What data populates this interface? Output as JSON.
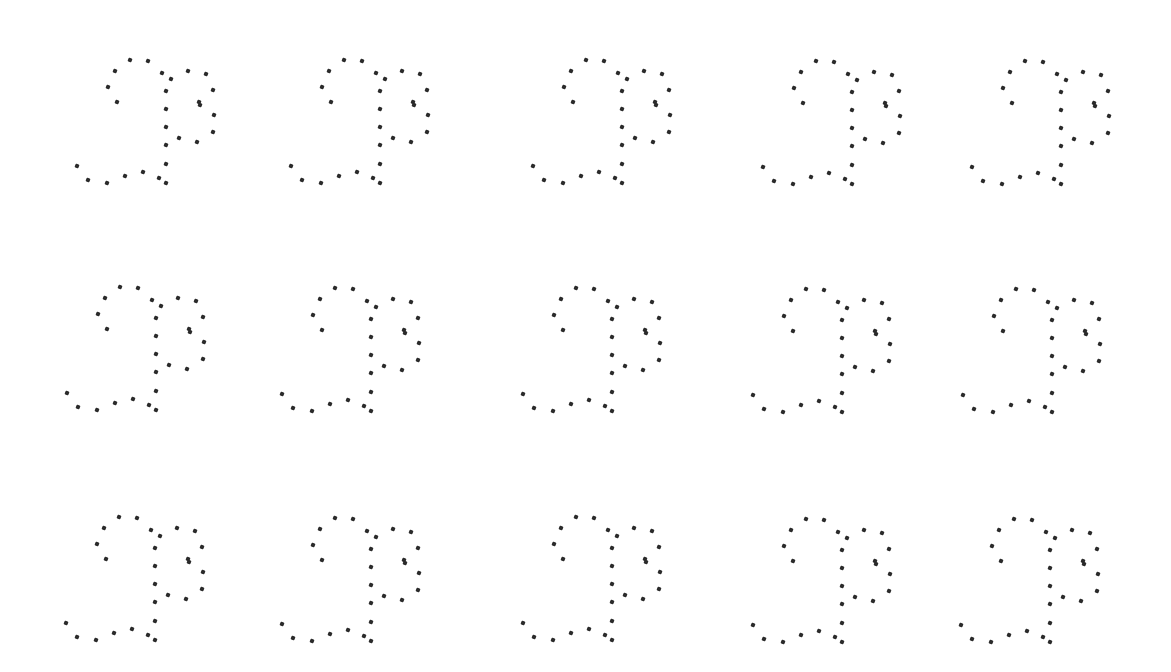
{
  "canvas": {
    "width": 1171,
    "height": 672,
    "background": "#ffffff",
    "dot_color": "#2a2a2a"
  },
  "glyph_dots": [
    [
      53,
      -106
    ],
    [
      71,
      -105
    ],
    [
      38,
      -95
    ],
    [
      31,
      -79
    ],
    [
      40,
      -64
    ],
    [
      85,
      -93
    ],
    [
      94,
      -87
    ],
    [
      111,
      -95
    ],
    [
      129,
      -92
    ],
    [
      136,
      -76
    ],
    [
      122,
      -64
    ],
    [
      123,
      -61
    ],
    [
      137,
      -51
    ],
    [
      136,
      -34
    ],
    [
      120,
      -24
    ],
    [
      102,
      -28
    ],
    [
      89,
      -75
    ],
    [
      89,
      -57
    ],
    [
      89,
      -39
    ],
    [
      89,
      -21
    ],
    [
      89,
      -2
    ],
    [
      89,
      17
    ],
    [
      0,
      0
    ],
    [
      11,
      14
    ],
    [
      30,
      17
    ],
    [
      48,
      10
    ],
    [
      66,
      6
    ],
    [
      82,
      12
    ]
  ],
  "grid": {
    "rows": 3,
    "cols": 5,
    "anchors": [
      [
        [
          77,
          166
        ],
        [
          291,
          166
        ],
        [
          533,
          166
        ],
        [
          763,
          167
        ],
        [
          972,
          167
        ]
      ],
      [
        [
          67,
          393
        ],
        [
          282,
          394
        ],
        [
          523,
          394
        ],
        [
          753,
          395
        ],
        [
          963,
          395
        ]
      ],
      [
        [
          66,
          623
        ],
        [
          282,
          624
        ],
        [
          523,
          623
        ],
        [
          753,
          625
        ],
        [
          961,
          625
        ]
      ]
    ]
  }
}
